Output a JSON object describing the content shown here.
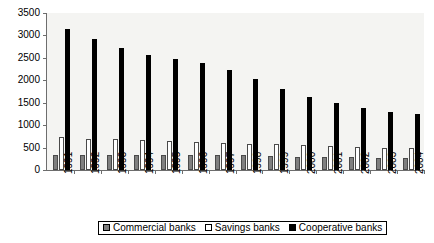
{
  "chart_data": {
    "type": "bar",
    "title": "",
    "xlabel": "",
    "ylabel": "",
    "ylim": [
      0,
      3500
    ],
    "yticks": [
      0,
      500,
      1000,
      1500,
      2000,
      2500,
      3000,
      3500
    ],
    "ytick_labels": [
      "0",
      "500",
      "1000",
      "1500",
      "2000",
      "2500",
      "3000",
      "3500"
    ],
    "grid": false,
    "legend_position": "bottom",
    "categories": [
      "1991",
      "1992",
      "1993",
      "1994",
      "1995",
      "1996",
      "1997",
      "1998",
      "1999",
      "2000",
      "2001",
      "2002",
      "2003",
      "2004"
    ],
    "series": [
      {
        "name": "Commercial banks",
        "color": "#7f7f7f",
        "values": [
          340,
          330,
          330,
          325,
          325,
          330,
          330,
          325,
          315,
          300,
          290,
          280,
          270,
          260
        ]
      },
      {
        "name": "Savings banks",
        "color": "#ffffff",
        "values": [
          730,
          700,
          700,
          680,
          640,
          620,
          600,
          590,
          580,
          560,
          540,
          520,
          500,
          480
        ]
      },
      {
        "name": "Cooperative banks",
        "color": "#000000",
        "values": [
          3140,
          2920,
          2720,
          2570,
          2480,
          2390,
          2230,
          2040,
          1800,
          1620,
          1490,
          1390,
          1300,
          1250
        ]
      }
    ]
  },
  "legend": {
    "items": [
      {
        "label": "Commercial banks",
        "swatch": "commercial-swatch"
      },
      {
        "label": "Savings banks",
        "swatch": "savings-swatch"
      },
      {
        "label": "Cooperative banks",
        "swatch": "cooperative-swatch"
      }
    ]
  }
}
